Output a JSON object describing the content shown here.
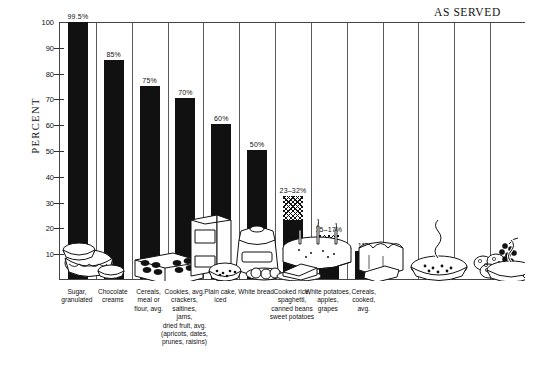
{
  "title": "AS SERVED",
  "axis": {
    "ylabel": "PERCENT",
    "yticks": [
      "100",
      "90",
      "80",
      "70",
      "60",
      "50",
      "40",
      "30",
      "20",
      "10"
    ],
    "ymin": 0,
    "ymax": 100
  },
  "chart_data": {
    "type": "bar",
    "title": "AS SERVED",
    "xlabel": "",
    "ylabel": "PERCENT",
    "ylim": [
      0,
      100
    ],
    "grid": false,
    "legend": "none",
    "value_format": "percent",
    "categories": [
      "Sugar, granulated",
      "Chocolate creams",
      "Cereals, meal or flour, avg.",
      "Cookies, avg. crackers, saltines, jams, dried fruit, avg. (apricots, dates, prunes, raisins)",
      "Plain cake, iced",
      "White bread",
      "Cooked rice, spaghetti, canned beans, sweet potatoes",
      "White potatoes, apples, grapes",
      "Cereals, cooked, avg."
    ],
    "values": [
      99.5,
      85,
      75,
      70,
      60,
      50,
      32,
      17,
      11
    ],
    "ranges": [
      null,
      null,
      null,
      null,
      null,
      null,
      [
        23,
        32
      ],
      [
        15,
        17
      ],
      null
    ],
    "labels": [
      "99.5%",
      "85%",
      "75%",
      "70%",
      "60%",
      "50%",
      "23–32%",
      "15–17%",
      "11%"
    ]
  },
  "bars": [
    {
      "name": "sugar-granulated",
      "label": "99.5%",
      "solid_to": 99.5,
      "hatch_from": null,
      "hatch_to": null,
      "caption": [
        "Sugar,",
        "granulated"
      ]
    },
    {
      "name": "chocolate-creams",
      "label": "85%",
      "solid_to": 85,
      "hatch_from": null,
      "hatch_to": null,
      "caption": [
        "Chocolate",
        "creams"
      ]
    },
    {
      "name": "cereals-meal-flour",
      "label": "75%",
      "solid_to": 75,
      "hatch_from": null,
      "hatch_to": null,
      "caption": [
        "Cereals,",
        "meal or",
        "flour, avg."
      ]
    },
    {
      "name": "cookies-crackers-jams-dried-fruit",
      "label": "70%",
      "solid_to": 70,
      "hatch_from": null,
      "hatch_to": null,
      "caption": [
        "Cookies, avg.",
        "crackers,",
        "saltines,",
        "jams,",
        "dried fruit, avg.",
        "(apricots, dates,",
        "prunes, raisins)"
      ]
    },
    {
      "name": "plain-cake-iced",
      "label": "60%",
      "solid_to": 60,
      "hatch_from": null,
      "hatch_to": null,
      "caption": [
        "Plain cake,",
        "iced"
      ]
    },
    {
      "name": "white-bread",
      "label": "50%",
      "solid_to": 50,
      "hatch_from": null,
      "hatch_to": null,
      "caption": [
        "White bread"
      ]
    },
    {
      "name": "cooked-rice-spaghetti-beans",
      "label": "23–32%",
      "solid_to": 23,
      "hatch_from": 23,
      "hatch_to": 32,
      "caption": [
        "Cooked rice,",
        "spaghetti,",
        "canned beans",
        "sweet potatoes"
      ]
    },
    {
      "name": "white-potatoes-apples-grapes",
      "label": "15–17%",
      "solid_to": 15,
      "hatch_from": 15,
      "hatch_to": 17,
      "caption": [
        "White potatoes,",
        "apples,",
        "grapes"
      ]
    },
    {
      "name": "cereals-cooked",
      "label": "11%",
      "solid_to": 11,
      "hatch_from": null,
      "hatch_to": null,
      "caption": [
        "Cereals,",
        "cooked,",
        "avg."
      ]
    }
  ],
  "colors": {
    "bar_solid": "#111111",
    "axis": "#444444",
    "background": "#ffffff",
    "ink": "#111111"
  }
}
